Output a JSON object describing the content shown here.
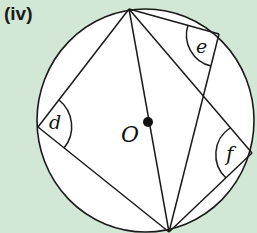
{
  "figure": {
    "part_label": "(iv)",
    "center_label": "O",
    "angles": [
      {
        "name": "d",
        "label": "d"
      },
      {
        "name": "e",
        "label": "e"
      },
      {
        "name": "f",
        "label": "f"
      }
    ]
  },
  "colors": {
    "background": "#d2e7d5",
    "circle_fill": "#ffffff",
    "stroke": "#1a1a1a"
  }
}
